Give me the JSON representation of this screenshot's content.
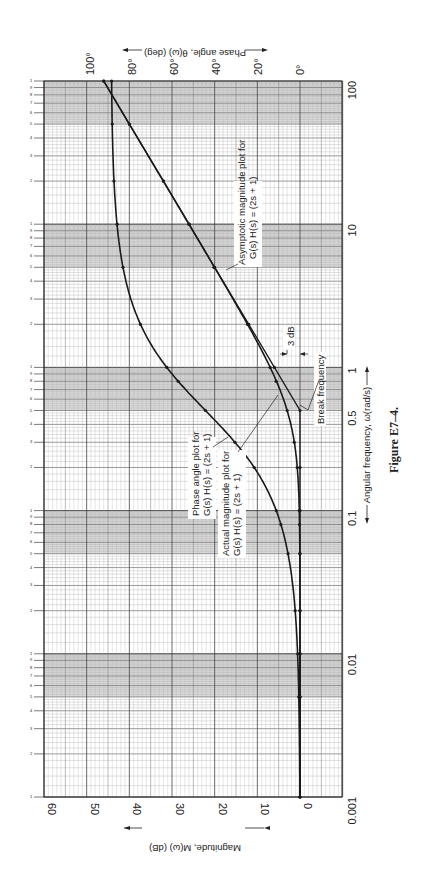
{
  "chart_data": {
    "type": "line",
    "orientation": "rotated-90-clockwise",
    "title": "",
    "caption": "Figure E7–4.",
    "xlabel": "← Angular frequency, ω(rad/s) →",
    "xlabel_text": "Angular frequency, ω(rad/s)",
    "xscale": "log",
    "xlim": [
      0.001,
      100
    ],
    "x_ticks": [
      "0.001",
      "0.01",
      "0.1",
      "0.5",
      "1",
      "10",
      "100"
    ],
    "x_tick_values": [
      0.001,
      0.01,
      0.1,
      0.5,
      1,
      10,
      100
    ],
    "ylabel_left": "Magnitude, M(ω) (dB)",
    "ylim_left": [
      -10,
      60
    ],
    "y_ticks_left": [
      "60",
      "50",
      "40",
      "30",
      "20",
      "10",
      "0"
    ],
    "y_tick_values_left": [
      60,
      50,
      40,
      30,
      20,
      10,
      0
    ],
    "ylabel_right": "Phase angle, θ(ω) (deg)",
    "ylim_right": [
      -20,
      115
    ],
    "y_ticks_right": [
      "100°",
      "80°",
      "60°",
      "40°",
      "20°",
      "0°"
    ],
    "y_tick_values_right": [
      100,
      80,
      60,
      40,
      20,
      0
    ],
    "grid": true,
    "cycle_labels": [
      "1",
      "2",
      "3",
      "4",
      "5",
      "6",
      "7",
      "8",
      "9"
    ],
    "series": [
      {
        "name": "Asymptotic magnitude plot for G(s) H(s) = (2s + 1)",
        "axis": "magnitude",
        "x": [
          0.001,
          0.005,
          0.01,
          0.02,
          0.05,
          0.1,
          0.2,
          0.5,
          1,
          2,
          5,
          10,
          20,
          50,
          100
        ],
        "values": [
          0,
          0,
          0,
          0,
          0,
          0,
          0,
          0,
          6.0,
          12.0,
          20.0,
          26.0,
          32.0,
          40.0,
          46.0
        ]
      },
      {
        "name": "Actual magnitude plot for G(s) H(s) = (2s + 1)",
        "axis": "magnitude",
        "x": [
          0.001,
          0.005,
          0.01,
          0.02,
          0.05,
          0.08,
          0.1,
          0.2,
          0.3,
          0.5,
          0.8,
          1,
          2,
          5,
          10,
          20,
          50,
          100
        ],
        "values": [
          0,
          0,
          0,
          0.01,
          0.04,
          0.11,
          0.17,
          0.64,
          1.34,
          3.0,
          5.6,
          7.0,
          12.3,
          20.2,
          26.0,
          32.0,
          40.0,
          46.0
        ]
      },
      {
        "name": "Phase angle plot for G(s) H(s) = (2s + 1)",
        "axis": "phase",
        "x": [
          0.001,
          0.005,
          0.01,
          0.02,
          0.05,
          0.08,
          0.1,
          0.2,
          0.3,
          0.5,
          0.8,
          1,
          2,
          5,
          10,
          20,
          50,
          100
        ],
        "values": [
          0.1,
          0.6,
          1.1,
          2.3,
          5.7,
          9.1,
          11.3,
          21.8,
          31.0,
          45.0,
          58.0,
          63.4,
          76.0,
          84.3,
          87.1,
          88.6,
          89.4,
          89.7
        ]
      }
    ],
    "annotations": [
      {
        "text": "Asymptotic magnitude plot for",
        "line2": "G(s) H(s) = (2s + 1)"
      },
      {
        "text": "Phase angle plot for",
        "line2": "G(s) H(s) = (2s + 1)"
      },
      {
        "text": "Actual magnitude plot for",
        "line2": "G(s) H(s) = (2s + 1)"
      },
      {
        "text": "3 dB"
      },
      {
        "text": "Break frequency",
        "value": 0.5
      }
    ]
  }
}
